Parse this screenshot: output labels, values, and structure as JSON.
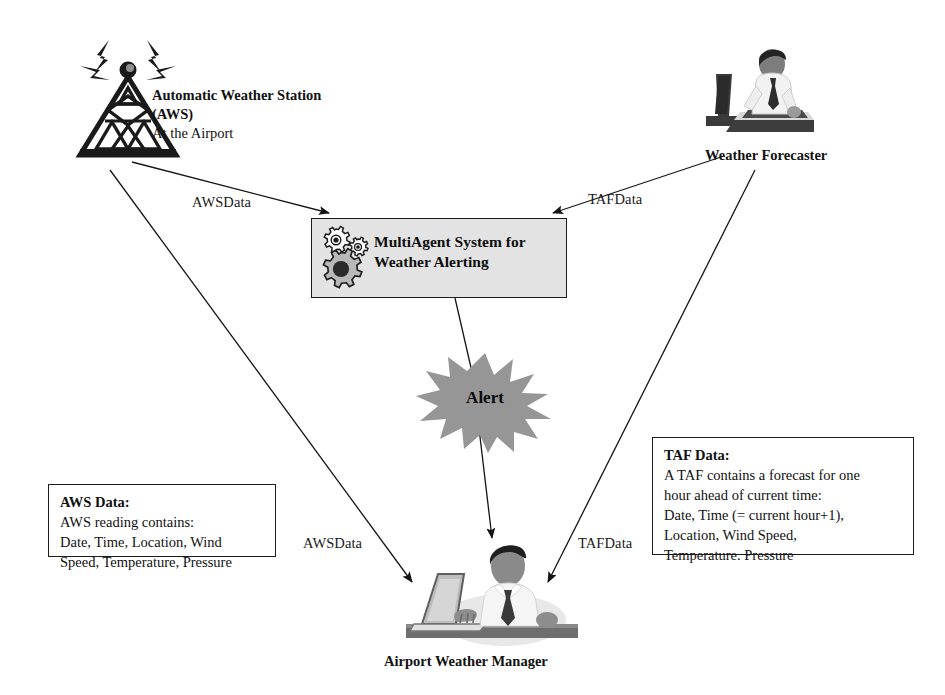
{
  "nodes": {
    "aws_station": {
      "icon": "radio-tower-icon",
      "label_bold": "Automatic Weather\nStation (AWS)",
      "label_plain": "At the Airport"
    },
    "weather_forecaster": {
      "icon": "person-at-desk-icon",
      "label": "Weather Forecaster"
    },
    "mas": {
      "icon": "gears-icon",
      "label": "MultiAgent System for\nWeather Alerting",
      "fill_color": "#e3e3e3",
      "border_color": "#1c1c1c"
    },
    "alert": {
      "icon": "starburst-icon",
      "label": "Alert",
      "fill_color": "#969696"
    },
    "airport_weather_manager": {
      "icon": "person-with-laptop-icon",
      "label": "Airport Weather Manager"
    }
  },
  "edges": [
    {
      "id": "aws-to-mas",
      "label": "AWSData",
      "from": "aws_station",
      "to": "mas"
    },
    {
      "id": "forecaster-to-mas",
      "label": "TAFData",
      "from": "weather_forecaster",
      "to": "mas"
    },
    {
      "id": "aws-to-manager",
      "label": "AWSData",
      "from": "aws_station",
      "to": "airport_weather_manager"
    },
    {
      "id": "forecaster-to-manager",
      "label": "TAFData",
      "from": "weather_forecaster",
      "to": "airport_weather_manager"
    },
    {
      "id": "mas-to-manager",
      "label": "",
      "from": "mas",
      "to": "airport_weather_manager"
    }
  ],
  "info_boxes": {
    "aws_data": {
      "title": "AWS Data:",
      "body": "AWS reading contains:\nDate, Time, Location, Wind\nSpeed, Temperature, Pressure"
    },
    "taf_data": {
      "title": "TAF Data:",
      "body": "A TAF contains a forecast for one\nhour ahead of current time:\nDate, Time (= current hour+1),\nLocation, Wind Speed,\nTemperature. Pressure"
    }
  },
  "colors": {
    "ink": "#111111",
    "box_fill": "#e3e3e3",
    "alert_fill": "#969696",
    "paper": "#ffffff"
  }
}
